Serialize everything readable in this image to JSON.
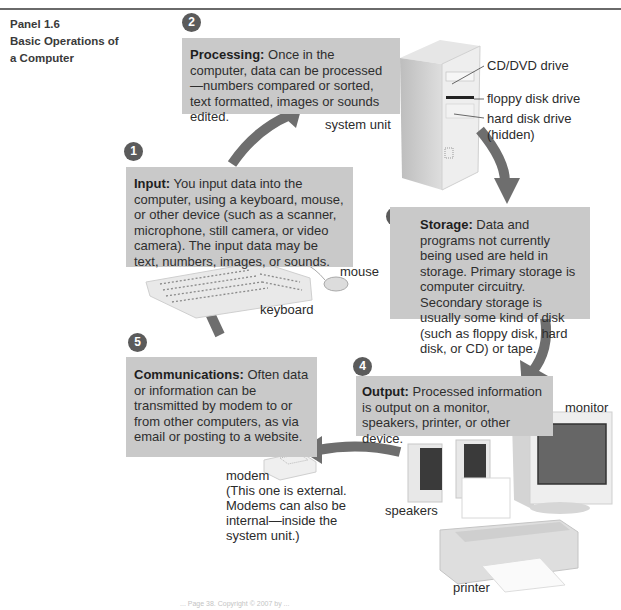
{
  "panel": {
    "number": "Panel 1.6",
    "title_line1": "Basic Operations of",
    "title_line2": "a Computer"
  },
  "steps": [
    {
      "number": "1",
      "heading": "Input:",
      "text": " You input data into the computer, using a keyboard, mouse, or other device (such as a scanner, microphone, still camera, or video camera). The input data may be text, numbers, images, or sounds."
    },
    {
      "number": "2",
      "heading": "Processing:",
      "text": " Once in the computer, data can be processed—numbers compared or sorted, text formatted, images or sounds edited."
    },
    {
      "number": "3",
      "heading": "Storage:",
      "text": " Data and programs not currently being used are held in storage. Primary storage is computer circuitry. Secondary storage is usually some kind of disk (such as floppy disk, hard disk, or CD) or tape."
    },
    {
      "number": "4",
      "heading": "Output:",
      "text": " Processed information is output on a monitor, speakers, printer, or other device."
    },
    {
      "number": "5",
      "heading": "Communications:",
      "text": " Often data or information can be transmitted by modem to or from other computers, as via email or posting to a website."
    }
  ],
  "labels": {
    "system_unit": "system unit",
    "cd_dvd": "CD/DVD drive",
    "floppy": "floppy disk drive",
    "hard_disk_1": "hard disk drive",
    "hard_disk_2": "(hidden)",
    "mouse": "mouse",
    "keyboard": "keyboard",
    "monitor": "monitor",
    "speakers": "speakers",
    "printer": "printer",
    "modem": "modem",
    "modem_note_1": "(This one is external.",
    "modem_note_2": "Modems can also be",
    "modem_note_3": "internal—inside the",
    "modem_note_4": "system unit.)"
  },
  "footer": "... Page 38. Copyright © 2007 by ...",
  "colors": {
    "box_fill": "#c9c9c9",
    "badge": "#5b5b5b",
    "arrow": "#6e6e6e"
  }
}
